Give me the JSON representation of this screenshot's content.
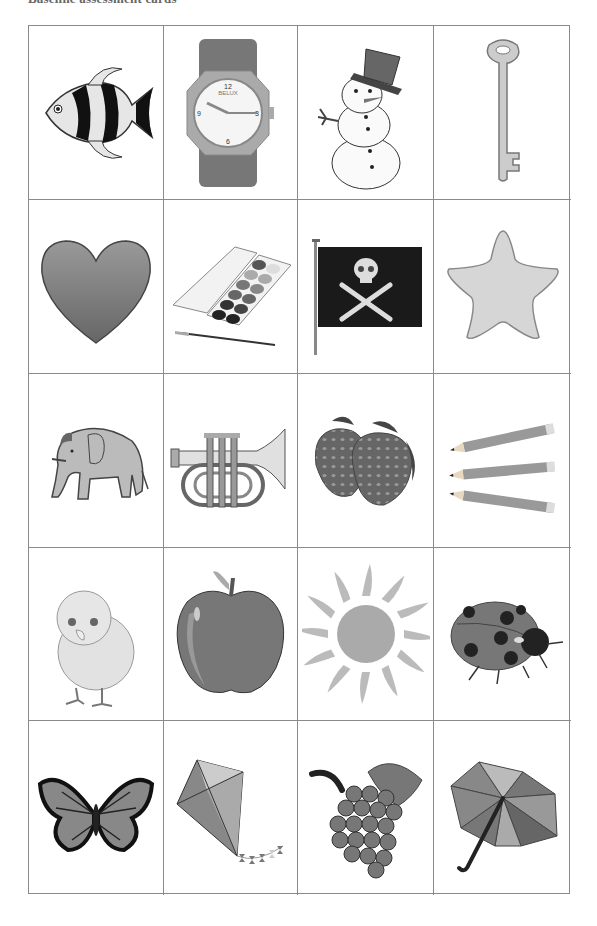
{
  "page": {
    "title": "Baseline assessment cards"
  },
  "grid": {
    "rows": 5,
    "columns": 4,
    "cards": [
      {
        "label": "fish",
        "icon": "fish-icon"
      },
      {
        "label": "watch",
        "icon": "watch-icon",
        "brand_text": "BELUX"
      },
      {
        "label": "snowman",
        "icon": "snowman-icon"
      },
      {
        "label": "key",
        "icon": "key-icon"
      },
      {
        "label": "heart",
        "icon": "heart-icon"
      },
      {
        "label": "paint box",
        "icon": "paint-box-icon"
      },
      {
        "label": "pirate flag",
        "icon": "pirate-flag-icon"
      },
      {
        "label": "star",
        "icon": "star-icon"
      },
      {
        "label": "elephant",
        "icon": "elephant-icon"
      },
      {
        "label": "trumpet",
        "icon": "trumpet-icon"
      },
      {
        "label": "strawberries",
        "icon": "strawberry-icon"
      },
      {
        "label": "pencils",
        "icon": "pencils-icon"
      },
      {
        "label": "chick",
        "icon": "chick-icon"
      },
      {
        "label": "apple",
        "icon": "apple-icon"
      },
      {
        "label": "sun",
        "icon": "sun-icon"
      },
      {
        "label": "ladybird",
        "icon": "ladybird-icon"
      },
      {
        "label": "butterfly",
        "icon": "butterfly-icon"
      },
      {
        "label": "kite",
        "icon": "kite-icon"
      },
      {
        "label": "grapes",
        "icon": "grapes-icon"
      },
      {
        "label": "umbrella",
        "icon": "umbrella-icon"
      }
    ]
  },
  "colors": {
    "border": "#8a8a8a",
    "background": "#ffffff"
  }
}
